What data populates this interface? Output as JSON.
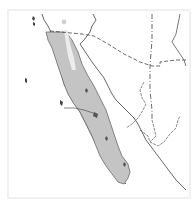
{
  "map": {
    "title": "",
    "region": "Baja California peninsula and northwestern Mexico",
    "colors": {
      "background": "#ffffff",
      "frame": "#ececec",
      "land_outline": "#555555",
      "range_fill": "#c4c4c4",
      "range_outline": "#6a6a6a",
      "gap_fill": "#e9e9e9",
      "border_dash": "#444444"
    },
    "features": [
      {
        "name": "range-area",
        "type": "shaded-distribution"
      },
      {
        "name": "international-border-us-mexico",
        "type": "dashed-line"
      },
      {
        "name": "state-borders",
        "type": "dashed-line"
      },
      {
        "name": "coastline",
        "type": "solid-line"
      },
      {
        "name": "islands",
        "type": "solid-shapes"
      }
    ]
  }
}
